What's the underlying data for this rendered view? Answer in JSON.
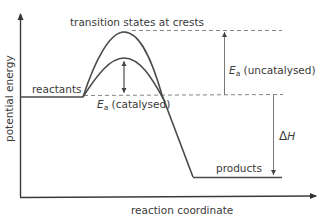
{
  "diagram": {
    "type": "energy-profile",
    "axes": {
      "y_label": "potential energy",
      "x_label": "reaction coordinate"
    },
    "labels": {
      "transition_states": "transition states at crests",
      "reactants": "reactants",
      "products": "products",
      "ea_uncatalysed_symbol": "E",
      "ea_uncatalysed_sub": "a",
      "ea_uncatalysed_text": " (uncatalysed)",
      "ea_catalysed_symbol": "E",
      "ea_catalysed_sub": "a",
      "ea_catalysed_text": " (catalysed)",
      "delta_h": "Δ",
      "delta_h_symbol": "H"
    },
    "colors": {
      "curve": "#4a4a4a",
      "axis": "#3a3a3a",
      "dashed": "#777777",
      "text": "#3a3a3a"
    }
  }
}
